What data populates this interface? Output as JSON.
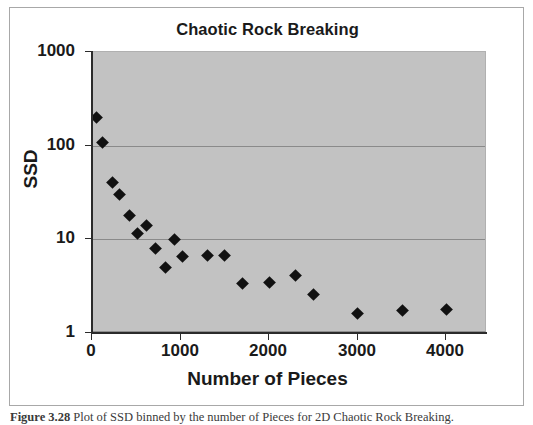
{
  "figure": {
    "caption_prefix": "Figure 3.28",
    "caption_text": "  Plot of SSD binned by the number of Pieces for 2D Chaotic Rock Breaking."
  },
  "chart_data": {
    "type": "scatter",
    "title": "Chaotic Rock Breaking",
    "xlabel": "Number of Pieces",
    "ylabel": "SSD",
    "xlim": [
      0,
      4460
    ],
    "ylim": [
      1,
      1000
    ],
    "yscale": "log",
    "xscale": "linear",
    "grid": true,
    "legend": "none",
    "plot_background": "#c2c2c2",
    "marker_color": "#111111",
    "marker_shape": "diamond",
    "xticks": [
      "0",
      "1000",
      "2000",
      "3000",
      "4000"
    ],
    "xtick_values": [
      0,
      1000,
      2000,
      3000,
      4000
    ],
    "yticks": [
      "1",
      "10",
      "100",
      "1000"
    ],
    "ytick_values": [
      1,
      10,
      100,
      1000
    ],
    "series": [
      {
        "name": "SSD",
        "points": [
          {
            "x": 50,
            "y": 200
          },
          {
            "x": 120,
            "y": 108
          },
          {
            "x": 230,
            "y": 40
          },
          {
            "x": 310,
            "y": 30
          },
          {
            "x": 420,
            "y": 18
          },
          {
            "x": 510,
            "y": 11.5
          },
          {
            "x": 620,
            "y": 14
          },
          {
            "x": 720,
            "y": 8
          },
          {
            "x": 830,
            "y": 5
          },
          {
            "x": 930,
            "y": 10
          },
          {
            "x": 1020,
            "y": 6.6
          },
          {
            "x": 1300,
            "y": 6.8
          },
          {
            "x": 1500,
            "y": 6.7
          },
          {
            "x": 1700,
            "y": 3.4
          },
          {
            "x": 2000,
            "y": 3.5
          },
          {
            "x": 2300,
            "y": 4.1
          },
          {
            "x": 2500,
            "y": 2.6
          },
          {
            "x": 3000,
            "y": 1.6
          },
          {
            "x": 3500,
            "y": 1.75
          },
          {
            "x": 4000,
            "y": 1.78
          }
        ]
      }
    ]
  }
}
